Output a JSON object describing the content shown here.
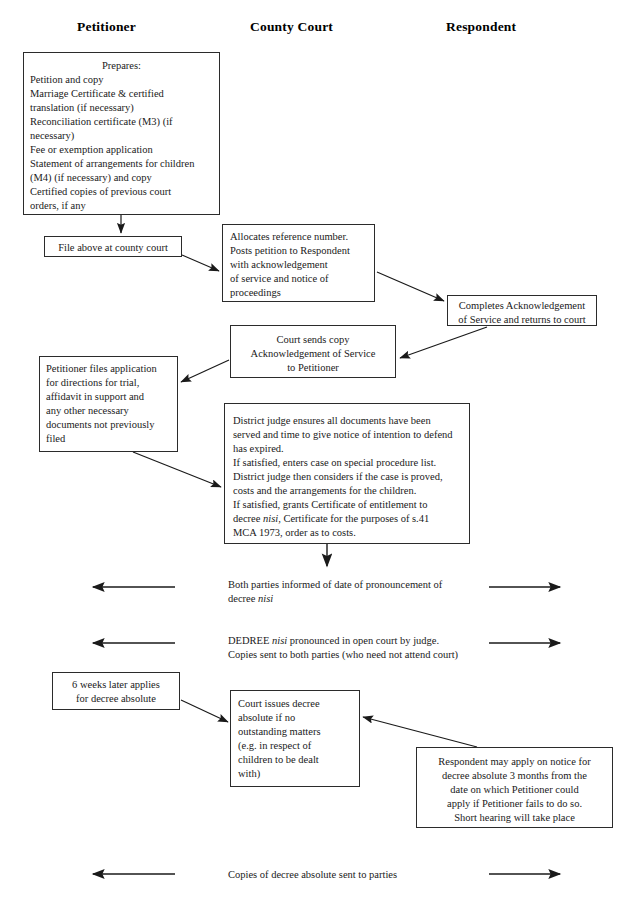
{
  "document": {
    "title": "Divorce procedure flowchart"
  },
  "columns": [
    {
      "name": "petitioner",
      "label": "Petitioner"
    },
    {
      "name": "county-court",
      "label": "County Court"
    },
    {
      "name": "respondent",
      "label": "Respondent"
    }
  ],
  "boxes": {
    "prepares": {
      "lines": [
        "Prepares:",
        "Petition and copy",
        "Marriage Certificate & certified",
        "translation (if necessary)",
        "Reconciliation certificate (M3) (if",
        "necessary)",
        "Fee or exemption application",
        "Statement of arrangements for children",
        "(M4) (if necessary) and copy",
        "Certified copies of previous court",
        "orders, if any"
      ]
    },
    "file_at_court": {
      "lines": [
        "File above at county court"
      ]
    },
    "allocates_reference": {
      "lines": [
        "Allocates reference number.",
        "Posts petition to Respondent",
        "with acknowledgement",
        "of service and notice of",
        "proceedings"
      ]
    },
    "completes_acknowledgement": {
      "lines": [
        "Completes Acknowledgement",
        "of Service and returns to court"
      ]
    },
    "court_sends_copy": {
      "lines": [
        "Court sends copy",
        "Acknowledgement of Service",
        "to Petitioner"
      ]
    },
    "petitioner_files_application": {
      "lines": [
        "Petitioner files application",
        "for directions for trial,",
        "affidavit in support and",
        "any other necessary",
        "documents not previously",
        "filed"
      ]
    },
    "district_judge": {
      "lines": [
        "District judge ensures all documents have been",
        "served and time to give notice of intention to defend",
        "has expired.",
        "If satisfied, enters case on special procedure list.",
        "District judge then considers if the case is proved,",
        "costs and the arrangements for the children.",
        "If satisfied, grants Certificate of entitlement to",
        "decree nisi, Certificate for the purposes of s.41",
        "MCA 1973,  order as to costs."
      ],
      "italic_word": "nisi"
    },
    "six_weeks_later": {
      "lines": [
        "6 weeks later applies",
        "for decree absolute"
      ]
    },
    "court_issues_decree": {
      "lines": [
        "Court issues decree",
        "absolute if no",
        "outstanding matters",
        "(e.g. in respect of",
        "children to be dealt",
        "with)"
      ]
    },
    "respondent_may_apply": {
      "lines": [
        "Respondent may apply on notice for",
        "decree absolute 3 months from the",
        "date on which Petitioner could",
        "apply if Petitioner fails to do so.",
        "Short hearing will take place"
      ]
    }
  },
  "flow_rows": [
    {
      "name": "pronouncement-notice",
      "lines": [
        "Both parties informed of date of pronouncement of",
        "decree nisi"
      ],
      "italic_word": "nisi",
      "left_arrow": "arrow-left",
      "right_arrow": "arrow-right"
    },
    {
      "name": "decree-nisi-pronounced",
      "lines": [
        "DEDREE nisi pronounced in open court by judge.",
        "Copies sent to both parties (who need not attend court)"
      ],
      "italic_word": "nisi",
      "left_arrow": "arrow-left",
      "right_arrow": "arrow-right"
    },
    {
      "name": "copies-decree-absolute",
      "lines": [
        "Copies of decree absolute sent to parties"
      ],
      "left_arrow": "arrow-left",
      "right_arrow": "arrow-right"
    }
  ],
  "colors": {
    "ink": "#1a1a1a",
    "line": "#2b2b2b",
    "background": "#ffffff"
  }
}
